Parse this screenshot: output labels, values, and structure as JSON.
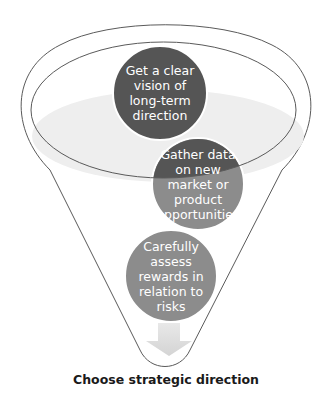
{
  "diagram": {
    "type": "funnel",
    "steps": [
      {
        "label": "Get a clear\nvision of\nlong-term\ndirection",
        "color": "#555555"
      },
      {
        "label": "Gather data\non new\nmarket or\nproduct\nopportunities",
        "color_top": "#555555",
        "color_bottom": "#8c8c8c"
      },
      {
        "label": "Carefully\nassess\nrewards in\nrelation to\nrisks",
        "color": "#8c8c8c"
      }
    ],
    "arrow": {
      "icon": "down-arrow-icon",
      "color": "#dcdcdc"
    },
    "caption": "Choose strategic direction",
    "colors": {
      "funnel_stroke": "#5a5a5a",
      "liquid_surface": "#eeeeee"
    }
  }
}
